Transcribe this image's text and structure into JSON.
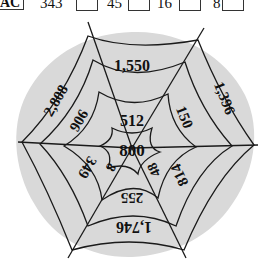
{
  "top_row": {
    "label": "AC",
    "items": [
      "343",
      "45",
      "16",
      "8"
    ]
  },
  "web": {
    "center": "800",
    "inner_ring": [
      "512",
      "48",
      "8"
    ],
    "middle_ring": [
      "906",
      "150",
      "814",
      "255",
      "349"
    ],
    "outer_ring": [
      "1,550",
      "1,396",
      "1,746",
      "2,808"
    ],
    "fill_color": "#d9d9d9",
    "line_color": "#1a1a1a"
  }
}
